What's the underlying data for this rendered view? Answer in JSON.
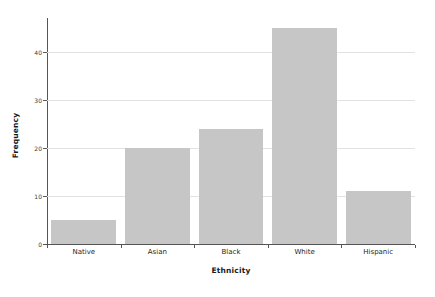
{
  "chart_data": {
    "type": "bar",
    "title": "",
    "subtitle": "",
    "xlabel": "Ethnicity",
    "ylabel": "Frequency",
    "categories": [
      "Native",
      "Asian",
      "Black",
      "White",
      "Hispanic"
    ],
    "values": [
      5,
      20,
      24,
      45,
      11
    ],
    "series": [
      {
        "name": "Frequency",
        "values": [
          5,
          20,
          24,
          45,
          11
        ]
      }
    ],
    "ylim": [
      0,
      47
    ],
    "xlim": [
      0,
      5
    ],
    "yticks": [
      0,
      10,
      20,
      30,
      40
    ],
    "ytick_labels": [
      "0",
      "10",
      "20",
      "30",
      "40"
    ],
    "grid": "horizontal",
    "legend": "none",
    "annotations": [],
    "bar_color": "#c6c6c6",
    "grid_color": "#e2e2e2",
    "axis_color": "#555555",
    "background_color": "#ffffff"
  }
}
